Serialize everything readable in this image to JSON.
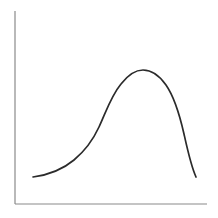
{
  "figure": {
    "title": "",
    "background_color": "#ffffff",
    "width": 218,
    "height": 218
  },
  "axes": {
    "color": "#8a8a8a",
    "stroke_width": 1.2,
    "y_axis_x": 15,
    "y_axis_top": 11,
    "y_axis_bottom": 204,
    "x_axis_y": 204,
    "x_axis_left": 15,
    "x_axis_right": 207,
    "ticks": "none",
    "tick_labels": "none",
    "gridlines": "none",
    "xlabel": "",
    "ylabel": ""
  },
  "curve": {
    "color": "#2b2b2b",
    "stroke_width": 1.7,
    "path": "M 33 177 C 48 175 62 170 74 160 C 86 150 93 140 99 127 C 106 112 111 96 121 84 C 128 75 135 70 143 70 C 151 70 159 75 166 85 C 173 95 179 112 184 134 C 188 152 191 166 196 177",
    "shape": "right-skewed unimodal hump with long flat left tail and steep right drop"
  },
  "chart_data": {
    "type": "line",
    "title": "",
    "xlabel": "",
    "ylabel": "",
    "grid": false,
    "legend": "none",
    "xlim": [
      0,
      100
    ],
    "ylim": [
      0,
      100
    ],
    "series": [
      {
        "name": "curve",
        "x": [
          9,
          19,
          28,
          36,
          44,
          52,
          57,
          62,
          67,
          72,
          77,
          82,
          87,
          91,
          94
        ],
        "values": [
          14,
          16,
          22,
          32,
          44,
          60,
          70,
          69,
          69,
          65,
          55,
          42,
          28,
          20,
          14
        ]
      }
    ]
  }
}
